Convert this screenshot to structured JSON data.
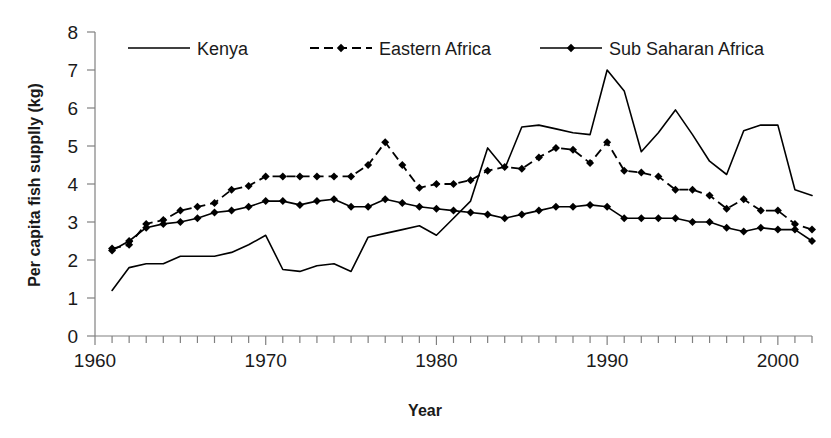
{
  "chart_data": {
    "type": "line",
    "title": "",
    "xlabel": "Year",
    "ylabel": "Per capita fish supplly (kg)",
    "xlim": [
      1960,
      2002
    ],
    "ylim": [
      0,
      8
    ],
    "ytick_labels": [
      "0",
      "1",
      "2",
      "3",
      "4",
      "5",
      "6",
      "7",
      "8"
    ],
    "ytick_values": [
      0,
      1,
      2,
      3,
      4,
      5,
      6,
      7,
      8
    ],
    "xtick_labels": [
      "1960",
      "1970",
      "1980",
      "1990",
      "2000"
    ],
    "xtick_values": [
      1960,
      1970,
      1980,
      1990,
      2000
    ],
    "xminor_tick_step": 1,
    "grid": false,
    "legend_position": "top-inside",
    "x": [
      1961,
      1962,
      1963,
      1964,
      1965,
      1966,
      1967,
      1968,
      1969,
      1970,
      1971,
      1972,
      1973,
      1974,
      1975,
      1976,
      1977,
      1978,
      1979,
      1980,
      1981,
      1982,
      1983,
      1984,
      1985,
      1986,
      1987,
      1988,
      1989,
      1990,
      1991,
      1992,
      1993,
      1994,
      1995,
      1996,
      1997,
      1998,
      1999,
      2000,
      2001,
      2002
    ],
    "series": [
      {
        "name": "Kenya",
        "style": "solid",
        "marker": "none",
        "color": "#000000",
        "values": [
          1.2,
          1.8,
          1.9,
          1.9,
          2.1,
          2.1,
          2.1,
          2.2,
          2.4,
          2.65,
          1.75,
          1.7,
          1.85,
          1.9,
          1.7,
          2.6,
          2.7,
          2.8,
          2.9,
          2.65,
          3.1,
          3.55,
          4.95,
          4.4,
          5.5,
          5.55,
          5.45,
          5.35,
          5.3,
          7.0,
          6.45,
          4.85,
          5.35,
          5.95,
          5.3,
          4.6,
          4.25,
          5.4,
          5.55,
          5.55,
          3.85,
          3.7
        ]
      },
      {
        "name": "Eastern Africa",
        "style": "dashed",
        "marker": "diamond",
        "color": "#000000",
        "values": [
          2.3,
          2.4,
          2.95,
          3.05,
          3.3,
          3.4,
          3.5,
          3.85,
          3.95,
          4.2,
          4.2,
          4.2,
          4.2,
          4.2,
          4.2,
          4.5,
          5.1,
          4.5,
          3.9,
          4.0,
          4.0,
          4.1,
          4.35,
          4.45,
          4.4,
          4.7,
          4.95,
          4.9,
          4.55,
          5.1,
          4.35,
          4.3,
          4.2,
          3.85,
          3.85,
          3.7,
          3.35,
          3.6,
          3.3,
          3.3,
          2.95,
          2.8
        ]
      },
      {
        "name": "Sub Saharan Africa",
        "style": "solid",
        "marker": "diamond",
        "color": "#000000",
        "values": [
          2.25,
          2.5,
          2.85,
          2.95,
          3.0,
          3.1,
          3.25,
          3.3,
          3.4,
          3.55,
          3.55,
          3.45,
          3.55,
          3.6,
          3.4,
          3.4,
          3.6,
          3.5,
          3.4,
          3.35,
          3.3,
          3.25,
          3.2,
          3.1,
          3.2,
          3.3,
          3.4,
          3.4,
          3.45,
          3.4,
          3.1,
          3.1,
          3.1,
          3.1,
          3.0,
          3.0,
          2.85,
          2.75,
          2.85,
          2.8,
          2.8,
          2.5
        ]
      }
    ]
  },
  "legend": {
    "items": [
      {
        "label": "Kenya",
        "style": "solid",
        "marker": "none"
      },
      {
        "label": "Eastern Africa",
        "style": "dashed",
        "marker": "diamond"
      },
      {
        "label": "Sub Saharan Africa",
        "style": "solid",
        "marker": "diamond"
      }
    ]
  },
  "icons": {
    "legend_swatch_solid": "solid-line-swatch-icon",
    "legend_swatch_dashed": "dashed-line-swatch-icon",
    "marker_glyph": "diamond-marker-icon"
  }
}
